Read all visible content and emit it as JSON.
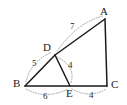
{
  "figure": {
    "type": "geometry-diagram",
    "background_color": "#ffffff",
    "solid_stroke_color": "#1a1a1a",
    "dotted_stroke_color": "#9a9a9a"
  },
  "vertices": [
    {
      "name": "A",
      "label": "A",
      "x": 105,
      "y": 19,
      "label_x": 100,
      "label_y": 6
    },
    {
      "name": "B",
      "label": "B",
      "x": 25,
      "y": 86,
      "label_x": 13,
      "label_y": 78
    },
    {
      "name": "C",
      "label": "C",
      "x": 107,
      "y": 86,
      "label_x": 111,
      "label_y": 79
    },
    {
      "name": "D",
      "label": "D",
      "x": 55,
      "y": 55,
      "label_x": 43,
      "label_y": 42
    },
    {
      "name": "E",
      "label": "E",
      "x": 70,
      "y": 86,
      "label_x": 66,
      "label_y": 88
    }
  ],
  "segments": [
    {
      "name": "segment-DA",
      "from": "D",
      "to": "A",
      "style": "solid"
    },
    {
      "name": "segment-AC",
      "from": "A",
      "to": "C",
      "style": "solid"
    },
    {
      "name": "segment-BC",
      "from": "B",
      "to": "C",
      "style": "solid"
    },
    {
      "name": "segment-BD",
      "from": "B",
      "to": "D",
      "style": "solid"
    },
    {
      "name": "segment-DE",
      "from": "D",
      "to": "E",
      "style": "solid"
    }
  ],
  "measure_labels": [
    {
      "name": "length-DA",
      "value": "7",
      "x": 70,
      "y": 22,
      "segment": "DA"
    },
    {
      "name": "length-BD",
      "value": "5",
      "x": 32,
      "y": 59,
      "segment": "BD"
    },
    {
      "name": "length-DE",
      "value": "4",
      "x": 68,
      "y": 61,
      "segment": "DE"
    },
    {
      "name": "length-BE",
      "value": "6",
      "x": 43,
      "y": 92,
      "segment": "BE"
    },
    {
      "name": "length-EC",
      "value": "4",
      "x": 89,
      "y": 91,
      "segment": "EC"
    }
  ],
  "measure_arcs": [
    {
      "name": "arc-DA",
      "d": "M 57 51 Q 78 22 103 16"
    },
    {
      "name": "arc-BD",
      "d": "M 26 82 Q 30 62 52 52"
    },
    {
      "name": "arc-DE",
      "d": "M 57 57 Q 76 66 71 83"
    },
    {
      "name": "arc-BE",
      "d": "M 26 89 Q 46 100 68 89"
    },
    {
      "name": "arc-EC",
      "d": "M 72 89 Q 90 99 106 89"
    }
  ]
}
